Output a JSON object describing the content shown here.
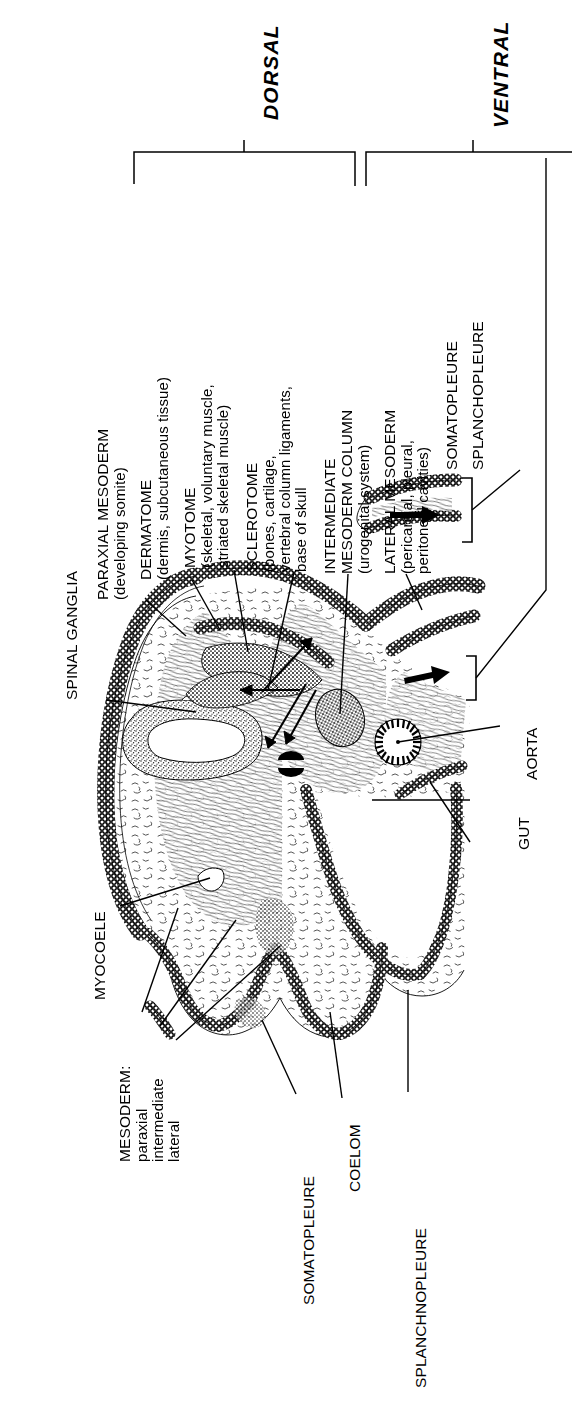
{
  "figure": {
    "kind": "anatomical-diagram",
    "axes": [
      {
        "id": "dorsal",
        "label": "DORSAL"
      },
      {
        "id": "ventral",
        "label": "VENTRAL"
      }
    ],
    "colors": {
      "ink": "#000000",
      "paper": "#ffffff"
    }
  },
  "labels": {
    "spinal_ganglia": {
      "title": "SPINAL GANGLIA",
      "detail": []
    },
    "paraxial_mesoderm": {
      "title": "PARAXIAL MESODERM",
      "detail": [
        "(developing somite)"
      ]
    },
    "dermatome": {
      "title": "DERMATOME",
      "detail": [
        "(dermis, subcutaneous tissue)"
      ]
    },
    "myotome": {
      "title": "MYOTOME",
      "detail": [
        "(skeletal, voluntary muscle,",
        "striated skeletal muscle)"
      ]
    },
    "sclerotome": {
      "title": "SCLEROTOME",
      "detail": [
        "(bones, cartilage,",
        "vertebral column ligaments,",
        "base of skull"
      ]
    },
    "intermediate_mesoderm_column": {
      "title": "INTERMEDIATE\nMESODERM COLUMN",
      "line1": "INTERMEDIATE",
      "line2": "MESODERM COLUMN",
      "detail": [
        "(urogenital system)"
      ]
    },
    "lateral_mesoderm": {
      "title": "LATERAL MESODERM",
      "detail": [
        "(pericardial, pleural,",
        "peritoneal cavities)"
      ]
    },
    "somatopleure_top": {
      "title": "SOMATOPLEURE"
    },
    "splanchopleure_top": {
      "title": "SPLANCHOPLEURE"
    },
    "aorta": {
      "title": "AORTA"
    },
    "gut": {
      "title": "GUT"
    },
    "myocoele": {
      "title": "MYOCOELE"
    },
    "mesoderm_group": {
      "title": "MESODERM:",
      "detail": [
        "paraxial",
        "intermediate",
        "lateral"
      ]
    },
    "somatopleure_bottom": {
      "title": "SOMATOPLEURE"
    },
    "coelom": {
      "title": "COELOM"
    },
    "splanchnopleure_bottom": {
      "title": "SPLANCHNOPLEURE"
    }
  }
}
